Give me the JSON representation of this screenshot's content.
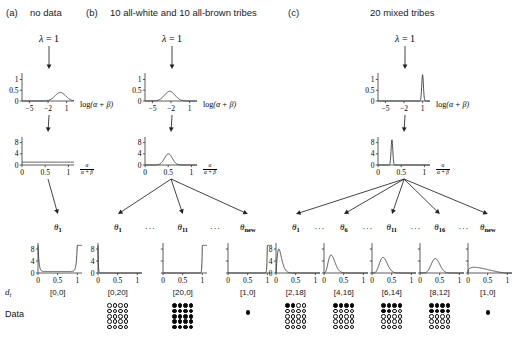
{
  "figure": {
    "width": 520,
    "height": 345,
    "background": "#ffffff",
    "line_color": "#333333",
    "row_labels": {
      "d_i": "d",
      "d_i_sub": "i",
      "data": "Data"
    },
    "ellipsis": "···"
  },
  "panels": [
    {
      "id": "a",
      "tag": "(a)",
      "title": "no data",
      "lambda_label": "λ = 1",
      "hyper_plot": {
        "ylabel_ticks": [
          "0",
          "0.5",
          "1"
        ],
        "xlabel_ticks": [
          "−5",
          "−2",
          "1"
        ],
        "xlabel": "log(α + β)",
        "ylim": [
          0,
          1.3
        ],
        "xlim": [
          -6.2,
          2.2
        ],
        "curve": "broad-bump",
        "peak_x": 0.0,
        "peak_y": 0.4
      },
      "mean_plot": {
        "ylabel_ticks": [
          "0",
          "4",
          "8"
        ],
        "xlabel_ticks": [
          "0",
          "0.5",
          "1"
        ],
        "xlabel_num": "α",
        "xlabel_den": "α + β",
        "ylim": [
          0,
          10
        ],
        "xlim": [
          0,
          1.12
        ],
        "curve": "uniform",
        "level": 1.0
      },
      "thetas": [
        {
          "label": "θ",
          "sub": "1",
          "ylabel_ticks": [
            "0",
            "4",
            "8"
          ],
          "xlabel_ticks": [
            "0",
            "0.5",
            "1"
          ],
          "ylim": [
            0,
            10
          ],
          "curve": "u-shape",
          "d": "[0,0]",
          "dots": null
        }
      ]
    },
    {
      "id": "b",
      "tag": "(b)",
      "title": "10 all-white and 10 all-brown tribes",
      "lambda_label": "λ = 1",
      "hyper_plot": {
        "ylabel_ticks": [
          "0",
          "0.5",
          "1"
        ],
        "xlabel_ticks": [
          "−5",
          "−2",
          "1"
        ],
        "xlabel": "log(α + β)",
        "ylim": [
          0,
          1.3
        ],
        "xlim": [
          -6.2,
          2.2
        ],
        "curve": "broad-bump",
        "peak_x": -2.2,
        "peak_y": 0.45
      },
      "mean_plot": {
        "ylabel_ticks": [
          "0",
          "4",
          "8"
        ],
        "xlabel_ticks": [
          "0",
          "0.5",
          "1"
        ],
        "xlabel_num": "α",
        "xlabel_den": "α + β",
        "ylim": [
          0,
          10
        ],
        "xlim": [
          0,
          1.12
        ],
        "curve": "bump",
        "peak_x": 0.5,
        "peak_y": 4.0
      },
      "thetas": [
        {
          "label": "θ",
          "sub": "1",
          "ylabel_ticks": [
            "0",
            "4",
            "8"
          ],
          "xlabel_ticks": [
            "0",
            "0.5",
            "1"
          ],
          "ylim": [
            0,
            10
          ],
          "curve": "spike-left",
          "d": "[0,20]",
          "dots": {
            "rows": 5,
            "cols": 4,
            "filled": 0,
            "total": 20,
            "style": "grid"
          }
        },
        {
          "label": "θ",
          "sub": "11",
          "ylabel_ticks": [
            "0",
            "4",
            "8"
          ],
          "xlabel_ticks": [
            "0",
            "0.5",
            "1"
          ],
          "ylim": [
            0,
            10
          ],
          "curve": "spike-right",
          "d": "[20,0]",
          "dots": {
            "rows": 5,
            "cols": 4,
            "filled": 20,
            "total": 20,
            "style": "grid"
          }
        },
        {
          "label": "θ",
          "sub": "new",
          "ylabel_ticks": [
            "0",
            "4",
            "8"
          ],
          "xlabel_ticks": [
            "0",
            "0.5",
            "1"
          ],
          "ylim": [
            0,
            10
          ],
          "curve": "spike-right",
          "d": "[1,0]",
          "dots": {
            "rows": 1,
            "cols": 1,
            "filled": 1,
            "total": 1,
            "style": "single"
          }
        }
      ]
    },
    {
      "id": "c",
      "tag": "(c)",
      "title": "20 mixed tribes",
      "lambda_label": "λ = 1",
      "hyper_plot": {
        "ylabel_ticks": [
          "0",
          "0.5",
          "1"
        ],
        "xlabel_ticks": [
          "−5",
          "−2",
          "1"
        ],
        "xlabel": "log(α + β)",
        "ylim": [
          0,
          1.3
        ],
        "xlim": [
          -6.2,
          2.2
        ],
        "curve": "sharp-spike",
        "peak_x": 1.0,
        "peak_y": 1.22
      },
      "mean_plot": {
        "ylabel_ticks": [
          "0",
          "4",
          "8"
        ],
        "xlabel_ticks": [
          "0",
          "0.5",
          "1"
        ],
        "xlabel_num": "α",
        "xlabel_den": "α + β",
        "ylim": [
          0,
          10
        ],
        "xlim": [
          0,
          1.12
        ],
        "curve": "sharp-spike",
        "peak_x": 0.3,
        "peak_y": 9.0
      },
      "thetas": [
        {
          "label": "θ",
          "sub": "1",
          "ylabel_ticks": [
            "0",
            "4",
            "8"
          ],
          "xlabel_ticks": [
            "0",
            "0.5",
            "1"
          ],
          "ylim": [
            0,
            10
          ],
          "curve": "beta",
          "peak_x": 0.11,
          "peak_y": 8.0,
          "d": "[2,18]",
          "dots": {
            "rows": 5,
            "cols": 4,
            "filled": 2,
            "total": 20,
            "style": "grid"
          }
        },
        {
          "label": "θ",
          "sub": "6",
          "ylabel_ticks": [
            "0",
            "4",
            "8"
          ],
          "xlabel_ticks": [
            "0",
            "0.5",
            "1"
          ],
          "ylim": [
            0,
            10
          ],
          "curve": "beta",
          "peak_x": 0.21,
          "peak_y": 6.0,
          "d": "[4,16]",
          "dots": {
            "rows": 5,
            "cols": 4,
            "filled": 4,
            "total": 20,
            "style": "grid"
          }
        },
        {
          "label": "θ",
          "sub": "11",
          "ylabel_ticks": [
            "0",
            "4",
            "8"
          ],
          "xlabel_ticks": [
            "0",
            "0.5",
            "1"
          ],
          "ylim": [
            0,
            10
          ],
          "curve": "beta",
          "peak_x": 0.3,
          "peak_y": 5.2,
          "d": "[6,14]",
          "dots": {
            "rows": 5,
            "cols": 4,
            "filled": 6,
            "total": 20,
            "style": "grid"
          }
        },
        {
          "label": "θ",
          "sub": "16",
          "ylabel_ticks": [
            "0",
            "4",
            "8"
          ],
          "xlabel_ticks": [
            "0",
            "0.5",
            "1"
          ],
          "ylim": [
            0,
            10
          ],
          "curve": "beta",
          "peak_x": 0.4,
          "peak_y": 4.8,
          "d": "[8,12]",
          "dots": {
            "rows": 5,
            "cols": 4,
            "filled": 8,
            "total": 20,
            "style": "grid"
          }
        },
        {
          "label": "θ",
          "sub": "new",
          "ylabel_ticks": [
            "0",
            "4",
            "8"
          ],
          "xlabel_ticks": [
            "0",
            "0.5",
            "1"
          ],
          "ylim": [
            0,
            10
          ],
          "curve": "broad-beta",
          "peak_x": 0.33,
          "peak_y": 1.9,
          "d": "[1,0]",
          "dots": {
            "rows": 1,
            "cols": 1,
            "filled": 1,
            "total": 1,
            "style": "single"
          }
        }
      ]
    }
  ],
  "chart_data": {
    "type": "line",
    "subplots": [
      {
        "panel": "a",
        "name": "no data",
        "row": "hyperprior log(alpha+beta)",
        "xlabel": "log(α + β)",
        "ylabel": "",
        "xticks": [
          -5,
          -2,
          1
        ],
        "yticks": [
          0,
          0.5,
          1
        ],
        "xlim": [
          -6.2,
          2.2
        ],
        "ylim": [
          0,
          1.3
        ],
        "peak_x": 0.0,
        "peak_y": 0.4,
        "shape": "broad unimodal bump"
      },
      {
        "panel": "a",
        "name": "no data",
        "row": "mean alpha/(alpha+beta)",
        "xlabel": "α/(α + β)",
        "ylabel": "",
        "xticks": [
          0,
          0.5,
          1
        ],
        "yticks": [
          0,
          4,
          8
        ],
        "xlim": [
          0,
          1.12
        ],
        "ylim": [
          0,
          10
        ],
        "shape": "flat uniform at density 1"
      },
      {
        "panel": "a",
        "name": "theta_1",
        "row": "theta",
        "xticks": [
          0,
          0.5,
          1
        ],
        "yticks": [
          0,
          4,
          8
        ],
        "ylim": [
          0,
          10
        ],
        "shape": "U-shaped (bathtub), spikes at 0 and 1",
        "data_counts": "[0,0]"
      },
      {
        "panel": "b",
        "name": "10 all-white and 10 all-brown tribes",
        "row": "hyperprior log(alpha+beta)",
        "xlabel": "log(α + β)",
        "xticks": [
          -5,
          -2,
          1
        ],
        "yticks": [
          0,
          0.5,
          1
        ],
        "xlim": [
          -6.2,
          2.2
        ],
        "ylim": [
          0,
          1.3
        ],
        "peak_x": -2.2,
        "peak_y": 0.45,
        "shape": "broad unimodal bump shifted left"
      },
      {
        "panel": "b",
        "row": "mean alpha/(alpha+beta)",
        "xlabel": "α/(α + β)",
        "xticks": [
          0,
          0.5,
          1
        ],
        "yticks": [
          0,
          4,
          8
        ],
        "xlim": [
          0,
          1.12
        ],
        "ylim": [
          0,
          10
        ],
        "peak_x": 0.5,
        "peak_y": 4.0,
        "shape": "unimodal centered at 0.5"
      },
      {
        "panel": "b",
        "name": "theta_1",
        "row": "theta",
        "xticks": [
          0,
          0.5,
          1
        ],
        "yticks": [
          0,
          4,
          8
        ],
        "ylim": [
          0,
          10
        ],
        "shape": "sharp spike at 0",
        "data_counts": "[0,20]",
        "dots_filled": 0,
        "dots_total": 20
      },
      {
        "panel": "b",
        "name": "theta_11",
        "row": "theta",
        "xticks": [
          0,
          0.5,
          1
        ],
        "yticks": [
          0,
          4,
          8
        ],
        "ylim": [
          0,
          10
        ],
        "shape": "sharp spike at 1",
        "data_counts": "[20,0]",
        "dots_filled": 20,
        "dots_total": 20
      },
      {
        "panel": "b",
        "name": "theta_new",
        "row": "theta",
        "xticks": [
          0,
          0.5,
          1
        ],
        "yticks": [
          0,
          4,
          8
        ],
        "ylim": [
          0,
          10
        ],
        "shape": "sharp spike at 1",
        "data_counts": "[1,0]",
        "dots_filled": 1,
        "dots_total": 1
      },
      {
        "panel": "c",
        "name": "20 mixed tribes",
        "row": "hyperprior log(alpha+beta)",
        "xlabel": "log(α + β)",
        "xticks": [
          -5,
          -2,
          1
        ],
        "yticks": [
          0,
          0.5,
          1
        ],
        "xlim": [
          -6.2,
          2.2
        ],
        "ylim": [
          0,
          1.3
        ],
        "peak_x": 1.0,
        "peak_y": 1.22,
        "shape": "narrow sharp spike near 1"
      },
      {
        "panel": "c",
        "row": "mean alpha/(alpha+beta)",
        "xlabel": "α/(α + β)",
        "xticks": [
          0,
          0.5,
          1
        ],
        "yticks": [
          0,
          4,
          8
        ],
        "xlim": [
          0,
          1.12
        ],
        "ylim": [
          0,
          10
        ],
        "peak_x": 0.3,
        "peak_y": 9.0,
        "shape": "narrow sharp spike near 0.3"
      },
      {
        "panel": "c",
        "name": "theta_1",
        "row": "theta",
        "xticks": [
          0,
          0.5,
          1
        ],
        "yticks": [
          0,
          4,
          8
        ],
        "ylim": [
          0,
          10
        ],
        "peak_x": 0.11,
        "peak_y": 8.0,
        "shape": "right-skewed beta",
        "data_counts": "[2,18]",
        "dots_filled": 2,
        "dots_total": 20
      },
      {
        "panel": "c",
        "name": "theta_6",
        "row": "theta",
        "xticks": [
          0,
          0.5,
          1
        ],
        "yticks": [
          0,
          4,
          8
        ],
        "ylim": [
          0,
          10
        ],
        "peak_x": 0.21,
        "peak_y": 6.0,
        "shape": "right-skewed beta",
        "data_counts": "[4,16]",
        "dots_filled": 4,
        "dots_total": 20
      },
      {
        "panel": "c",
        "name": "theta_11",
        "row": "theta",
        "xticks": [
          0,
          0.5,
          1
        ],
        "yticks": [
          0,
          4,
          8
        ],
        "ylim": [
          0,
          10
        ],
        "peak_x": 0.3,
        "peak_y": 5.2,
        "shape": "beta",
        "data_counts": "[6,14]",
        "dots_filled": 6,
        "dots_total": 20
      },
      {
        "panel": "c",
        "name": "theta_16",
        "row": "theta",
        "xticks": [
          0,
          0.5,
          1
        ],
        "yticks": [
          0,
          4,
          8
        ],
        "ylim": [
          0,
          10
        ],
        "peak_x": 0.4,
        "peak_y": 4.8,
        "shape": "beta",
        "data_counts": "[8,12]",
        "dots_filled": 8,
        "dots_total": 20
      },
      {
        "panel": "c",
        "name": "theta_new",
        "row": "theta",
        "xticks": [
          0,
          0.5,
          1
        ],
        "yticks": [
          0,
          4,
          8
        ],
        "ylim": [
          0,
          10
        ],
        "peak_x": 0.33,
        "peak_y": 1.9,
        "shape": "broad low beta",
        "data_counts": "[1,0]",
        "dots_filled": 1,
        "dots_total": 1
      }
    ]
  }
}
